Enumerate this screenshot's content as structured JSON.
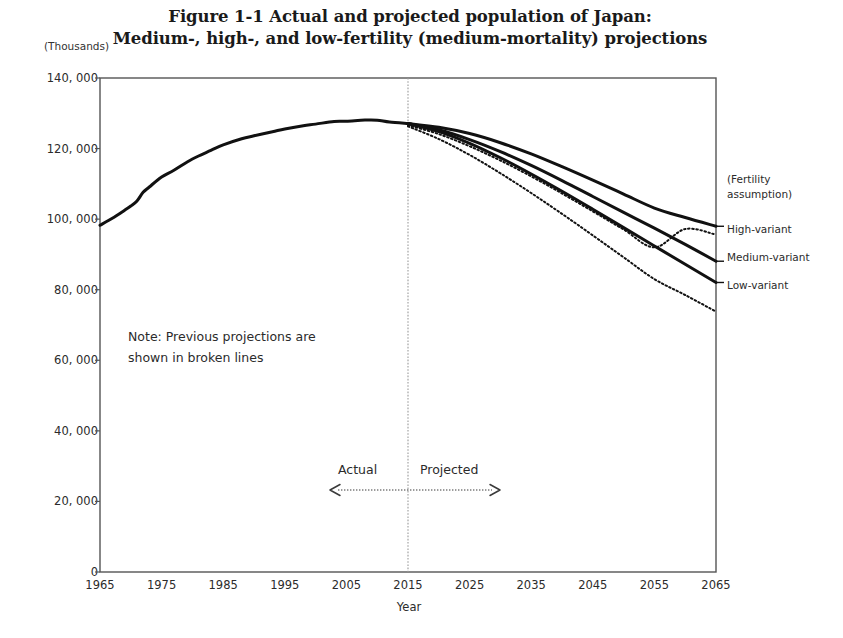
{
  "title": {
    "line1": "Figure 1-1 Actual and projected population of Japan:",
    "line2": "Medium-, high-, and low-fertility (medium-mortality) projections"
  },
  "axis": {
    "y_unit": "(Thousands)",
    "x_title": "Year"
  },
  "note": {
    "line1": "Note: Previous projections are",
    "line2": "shown in broken lines"
  },
  "periods": {
    "actual": "Actual",
    "projected": "Projected",
    "divider_year": 2015
  },
  "legend": {
    "heading_line1": "(Fertility",
    "heading_line2": "assumption)",
    "entries": [
      {
        "label": "High-variant",
        "value_2065": 98000
      },
      {
        "label": "Medium-variant",
        "value_2065": 88000
      },
      {
        "label": "Low-variant",
        "value_2065": 82000
      }
    ]
  },
  "colors": {
    "line": "#111111",
    "frame": "#555555",
    "divider": "#9a9a9a",
    "text": "#2b2b2b",
    "background": "#ffffff"
  },
  "chart_data": {
    "type": "line",
    "title": "Figure 1-1 Actual and projected population of Japan: Medium-, high-, and low-fertility (medium-mortality) projections",
    "xlabel": "Year",
    "ylabel": "(Thousands)",
    "xlim": [
      1965,
      2065
    ],
    "ylim": [
      0,
      140000
    ],
    "xticks": [
      1965,
      1975,
      1985,
      1995,
      2005,
      2015,
      2025,
      2035,
      2045,
      2055,
      2065
    ],
    "yticks": [
      0,
      20000,
      40000,
      60000,
      80000,
      100000,
      120000,
      140000
    ],
    "ytick_labels": [
      "0",
      "20, 000",
      "40, 000",
      "60, 000",
      "80, 000",
      "100, 000",
      "120, 000",
      "140, 000"
    ],
    "grid": false,
    "legend_position": "right-outside",
    "annotations": [
      {
        "text": "Note: Previous projections are shown in broken lines",
        "x": 1985,
        "y": 68000
      },
      {
        "text": "Actual",
        "x": 2007,
        "y": 28000
      },
      {
        "text": "Projected",
        "x": 2024,
        "y": 28000
      },
      {
        "text": "(Fertility assumption)",
        "x": 2068,
        "y": 106000
      }
    ],
    "vline": {
      "x": 2015,
      "style": "dotted"
    },
    "series": [
      {
        "name": "Actual",
        "style": "solid",
        "width": 3,
        "x": [
          1965,
          1967,
          1969,
          1970,
          1971,
          1972,
          1973,
          1975,
          1977,
          1980,
          1983,
          1985,
          1988,
          1990,
          1993,
          1995,
          1998,
          2000,
          2003,
          2005,
          2008,
          2010,
          2012,
          2015
        ],
        "y": [
          98275,
          100243,
          102536,
          103720,
          105145,
          107595,
          109104,
          111940,
          113863,
          117060,
          119483,
          121049,
          122783,
          123611,
          124764,
          125570,
          126472,
          126926,
          127694,
          127768,
          128084,
          128057,
          127515,
          127095
        ]
      },
      {
        "name": "High-variant",
        "style": "solid",
        "width": 3,
        "x": [
          2015,
          2020,
          2025,
          2030,
          2035,
          2040,
          2045,
          2050,
          2055,
          2060,
          2065
        ],
        "y": [
          127095,
          126030,
          124250,
          121660,
          118480,
          114850,
          111030,
          107100,
          103150,
          100450,
          97980
        ]
      },
      {
        "name": "Medium-variant",
        "style": "solid",
        "width": 3,
        "x": [
          2015,
          2020,
          2025,
          2030,
          2035,
          2040,
          2045,
          2050,
          2055,
          2060,
          2065
        ],
        "y": [
          127095,
          125325,
          122544,
          119125,
          115216,
          110919,
          106421,
          101923,
          97441,
          92840,
          88077
        ]
      },
      {
        "name": "Low-variant",
        "style": "solid",
        "width": 3,
        "x": [
          2015,
          2020,
          2025,
          2030,
          2035,
          2040,
          2045,
          2050,
          2055,
          2060,
          2065
        ],
        "y": [
          127095,
          124800,
          121500,
          117400,
          112800,
          107900,
          102800,
          97600,
          92400,
          87200,
          82050
        ]
      },
      {
        "name": "Previous projection (upper)",
        "style": "dotted",
        "width": 2,
        "x": [
          2015,
          2020,
          2025,
          2030,
          2035,
          2040,
          2045,
          2050,
          2055,
          2060,
          2065
        ],
        "y": [
          126600,
          124100,
          120660,
          116620,
          112120,
          107280,
          102210,
          97080,
          92010,
          97200,
          95600
        ]
      },
      {
        "name": "Previous projection (lower)",
        "style": "dotted",
        "width": 2,
        "x": [
          2015,
          2020,
          2025,
          2030,
          2035,
          2040,
          2045,
          2050,
          2055,
          2060,
          2065
        ],
        "y": [
          126300,
          122700,
          118200,
          113000,
          107400,
          101500,
          95400,
          89200,
          83000,
          78500,
          73800
        ]
      }
    ]
  },
  "ticks": {
    "y": [
      {
        "label": "140, 000",
        "value": 140000
      },
      {
        "label": "120, 000",
        "value": 120000
      },
      {
        "label": "100, 000",
        "value": 100000
      },
      {
        "label": "80, 000",
        "value": 80000
      },
      {
        "label": "60, 000",
        "value": 60000
      },
      {
        "label": "40, 000",
        "value": 40000
      },
      {
        "label": "20, 000",
        "value": 20000
      },
      {
        "label": "0",
        "value": 0
      }
    ],
    "x": [
      {
        "label": "1965",
        "value": 1965
      },
      {
        "label": "1975",
        "value": 1975
      },
      {
        "label": "1985",
        "value": 1985
      },
      {
        "label": "1995",
        "value": 1995
      },
      {
        "label": "2005",
        "value": 2005
      },
      {
        "label": "2015",
        "value": 2015
      },
      {
        "label": "2025",
        "value": 2025
      },
      {
        "label": "2035",
        "value": 2035
      },
      {
        "label": "2045",
        "value": 2045
      },
      {
        "label": "2055",
        "value": 2055
      },
      {
        "label": "2065",
        "value": 2065
      }
    ]
  }
}
